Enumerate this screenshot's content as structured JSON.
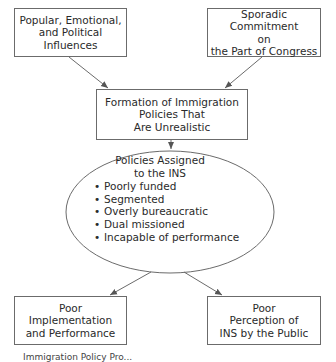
{
  "diagram": {
    "type": "flowchart",
    "nodes": {
      "popular_influences": {
        "label": "Popular, Emotional,\nand Political\nInfluences"
      },
      "sporadic_commitment": {
        "label": "Sporadic Commitment\non\nthe Part of Congress"
      },
      "formation": {
        "label": "Formation of Immigration\nPolicies That\nAre Unrealistic"
      },
      "policies_assigned": {
        "title": "Policies Assigned\nto the INS",
        "bullet_glyph": "•",
        "items": [
          "Poorly funded",
          "Segmented",
          "Overly bureaucratic",
          "Dual missioned",
          "Incapable of performance"
        ]
      },
      "poor_implementation": {
        "label": "Poor\nImplementation\nand Performance"
      },
      "poor_perception": {
        "label": "Poor\nPerception of\nINS by the Public"
      }
    },
    "edges": [
      {
        "from": "popular_influences",
        "to": "formation"
      },
      {
        "from": "sporadic_commitment",
        "to": "formation"
      },
      {
        "from": "formation",
        "to": "policies_assigned"
      },
      {
        "from": "policies_assigned",
        "to": "poor_implementation"
      },
      {
        "from": "policies_assigned",
        "to": "poor_perception"
      }
    ],
    "caption_partial": "Immigration Policy Pro..."
  },
  "colors": {
    "stroke": "#6b6b6b",
    "text": "#2a2a2a",
    "background": "#ffffff"
  }
}
